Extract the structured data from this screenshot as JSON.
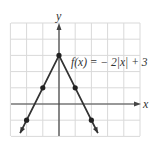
{
  "chart_data": {
    "type": "line",
    "title": "",
    "equation_label": "f(x) = − 2|x| + 3",
    "xlabel": "x",
    "ylabel": "y",
    "xlim": [
      -3,
      5
    ],
    "ylim": [
      -2,
      5
    ],
    "grid": true,
    "series": [
      {
        "name": "f(x) = -2|x| + 3",
        "x": [
          -2.4,
          0,
          2.4
        ],
        "y": [
          -1.8,
          3,
          -1.8
        ],
        "color": "#333333"
      }
    ],
    "points": [
      {
        "x": -2,
        "y": -1
      },
      {
        "x": -1,
        "y": 1
      },
      {
        "x": 0,
        "y": 3
      },
      {
        "x": 1,
        "y": 1
      },
      {
        "x": 2,
        "y": -1
      }
    ]
  },
  "labels": {
    "x_axis": "x",
    "y_axis": "y",
    "equation": "f(x) = − 2|x| + 3"
  },
  "colors": {
    "grid": "#d9d9d9",
    "axis": "#444444",
    "curve": "#333333",
    "point": "#222222"
  }
}
